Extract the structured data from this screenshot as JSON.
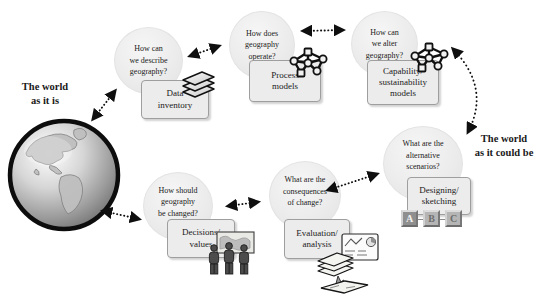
{
  "side_labels": {
    "left": "The world\nas it is",
    "right": "The world\nas it could be"
  },
  "nodes": [
    {
      "question": "How can\nwe describe\ngeography?",
      "activity": "Data\ninventory",
      "icon": "map-layers-icon"
    },
    {
      "question": "How does\ngeography\noperate?",
      "activity": "Process\nmodels",
      "icon": "node-network-icon"
    },
    {
      "question": "How can\nwe alter\ngeography?",
      "activity": "Capability/\nsustainability\nmodels",
      "icon": "node-network-icon"
    },
    {
      "question": "What are the\nalternative\nscenarios?",
      "activity": "Designing/\nsketching",
      "icon": "abc-option-boxes"
    },
    {
      "question": "What are the\nconsequences\nof change?",
      "activity": "Evaluation/\nanalysis",
      "icon": "map-analysis-icon"
    },
    {
      "question": "How should\ngeography\nbe changed?",
      "activity": "Decisions/\nvalues",
      "icon": "people-at-map-icon"
    }
  ],
  "scenario_options": [
    "A",
    "B",
    "C"
  ],
  "connections": [
    {
      "from": "the-world-as-it-is",
      "to": "how-can-we-describe-geography",
      "style": "dotted-double-arrow"
    },
    {
      "from": "how-can-we-describe-geography",
      "to": "how-does-geography-operate",
      "style": "dotted-double-arrow"
    },
    {
      "from": "how-does-geography-operate",
      "to": "how-can-we-alter-geography",
      "style": "dotted-double-arrow"
    },
    {
      "from": "how-can-we-alter-geography",
      "to": "what-are-the-alternative-scenarios",
      "style": "dotted-double-arrow-curved"
    },
    {
      "from": "what-are-the-alternative-scenarios",
      "to": "what-are-the-consequences-of-change",
      "style": "dotted-double-arrow"
    },
    {
      "from": "what-are-the-consequences-of-change",
      "to": "how-should-geography-be-changed",
      "style": "dotted-double-arrow"
    },
    {
      "from": "how-should-geography-be-changed",
      "to": "the-world-as-it-is",
      "style": "dotted-double-arrow"
    }
  ],
  "colors": {
    "box_fill": "#ececec",
    "box_border": "#9e9e9e",
    "circle_fill": "#ededed",
    "arrow": "#111111",
    "option_selected": "#8f8f8f",
    "option_other": "#b5b5b5"
  }
}
